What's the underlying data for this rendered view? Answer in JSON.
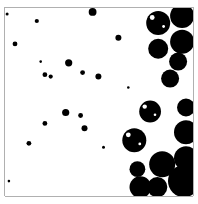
{
  "figure": {
    "background_color": "#ffffff",
    "circle_color": "#000000",
    "border_color": "#b0b0b0",
    "highlight_color": "#ffffff"
  },
  "chart_data": {
    "type": "scatter",
    "title": "",
    "xlabel": "",
    "ylabel": "",
    "xlim": [
      0,
      1
    ],
    "ylim": [
      0,
      1
    ],
    "grid": false,
    "legend": "none",
    "points_note": "x,y normalized within the square (0..1, origin top-left); size normalized to square width",
    "points": [
      {
        "x": 0.011,
        "y": 0.037,
        "size": 0.008
      },
      {
        "x": 0.169,
        "y": 0.074,
        "size": 0.011
      },
      {
        "x": 0.466,
        "y": 0.026,
        "size": 0.021
      },
      {
        "x": 0.053,
        "y": 0.195,
        "size": 0.013
      },
      {
        "x": 0.603,
        "y": 0.163,
        "size": 0.016
      },
      {
        "x": 0.19,
        "y": 0.289,
        "size": 0.007
      },
      {
        "x": 0.339,
        "y": 0.295,
        "size": 0.019
      },
      {
        "x": 0.212,
        "y": 0.358,
        "size": 0.013
      },
      {
        "x": 0.243,
        "y": 0.368,
        "size": 0.011
      },
      {
        "x": 0.413,
        "y": 0.347,
        "size": 0.013
      },
      {
        "x": 0.497,
        "y": 0.368,
        "size": 0.016
      },
      {
        "x": 0.656,
        "y": 0.426,
        "size": 0.007
      },
      {
        "x": 0.323,
        "y": 0.558,
        "size": 0.019
      },
      {
        "x": 0.402,
        "y": 0.574,
        "size": 0.013
      },
      {
        "x": 0.423,
        "y": 0.642,
        "size": 0.016
      },
      {
        "x": 0.212,
        "y": 0.616,
        "size": 0.013
      },
      {
        "x": 0.127,
        "y": 0.721,
        "size": 0.013
      },
      {
        "x": 0.524,
        "y": 0.742,
        "size": 0.008
      },
      {
        "x": 0.021,
        "y": 0.921,
        "size": 0.007
      },
      {
        "x": 0.815,
        "y": 0.084,
        "size": 0.064,
        "highlight": true
      },
      {
        "x": 0.942,
        "y": 0.047,
        "size": 0.064
      },
      {
        "x": 0.942,
        "y": 0.184,
        "size": 0.064
      },
      {
        "x": 0.815,
        "y": 0.221,
        "size": 0.053
      },
      {
        "x": 0.921,
        "y": 0.289,
        "size": 0.048
      },
      {
        "x": 0.878,
        "y": 0.379,
        "size": 0.048
      },
      {
        "x": 0.963,
        "y": 0.532,
        "size": 0.048
      },
      {
        "x": 0.772,
        "y": 0.553,
        "size": 0.058,
        "highlight": true
      },
      {
        "x": 0.688,
        "y": 0.705,
        "size": 0.064,
        "highlight": true
      },
      {
        "x": 0.963,
        "y": 0.663,
        "size": 0.064
      },
      {
        "x": 0.963,
        "y": 0.8,
        "size": 0.064
      },
      {
        "x": 0.704,
        "y": 0.858,
        "size": 0.042
      },
      {
        "x": 0.836,
        "y": 0.832,
        "size": 0.069
      },
      {
        "x": 0.952,
        "y": 0.921,
        "size": 0.085
      },
      {
        "x": 0.72,
        "y": 0.953,
        "size": 0.058
      },
      {
        "x": 0.81,
        "y": 0.953,
        "size": 0.053
      }
    ]
  }
}
